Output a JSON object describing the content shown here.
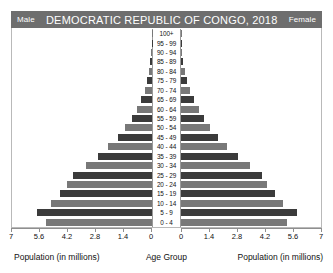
{
  "header": {
    "left_label": "Male",
    "title": "DEMOCRATIC REPUBLIC OF CONGO, 2018",
    "right_label": "Female"
  },
  "footer": {
    "left_caption": "Population (in millions)",
    "center_caption": "Age Group",
    "right_caption": "Population (in millions)"
  },
  "colors": {
    "header_background": "#6e6e6e",
    "header_text": "#ffffff",
    "bar_light": "#787878",
    "bar_dark": "#3b3b3b",
    "frame": "#b9b9b9",
    "axis": "#8f8f8f"
  },
  "chart_data": {
    "type": "bar",
    "subtype": "population-pyramid",
    "title": "DEMOCRATIC REPUBLIC OF CONGO, 2018",
    "xlabel": "Population (in millions)",
    "ylabel": "Age Group",
    "grid": false,
    "legend_position": "header",
    "axis_max": 7,
    "left_axis_ticks": [
      "7",
      "5.6",
      "4.2",
      "2.8",
      "1.4",
      "0"
    ],
    "right_axis_ticks": [
      "0",
      "1.4",
      "2.8",
      "4.2",
      "5.6",
      "7"
    ],
    "tick_values": [
      7,
      5.6,
      4.2,
      2.8,
      1.4,
      0
    ],
    "categories": [
      "100+",
      "95 - 99",
      "90 - 94",
      "85 - 89",
      "80 - 84",
      "75 - 79",
      "70 - 74",
      "65 - 69",
      "60 - 64",
      "55 - 59",
      "50 - 54",
      "45 - 49",
      "40 - 44",
      "35 - 39",
      "30 - 34",
      "25 - 29",
      "20 - 24",
      "15 - 19",
      "10 - 14",
      "5 - 9",
      "0 - 4"
    ],
    "series": [
      {
        "name": "Male",
        "side": "left",
        "values": [
          0.01,
          0.02,
          0.04,
          0.08,
          0.14,
          0.23,
          0.37,
          0.55,
          0.76,
          1.02,
          1.33,
          1.72,
          2.18,
          2.72,
          3.32,
          3.95,
          4.25,
          4.62,
          5.05,
          5.75,
          5.3
        ]
      },
      {
        "name": "Female",
        "side": "right",
        "values": [
          0.01,
          0.03,
          0.06,
          0.11,
          0.19,
          0.3,
          0.46,
          0.66,
          0.89,
          1.15,
          1.47,
          1.86,
          2.32,
          2.86,
          3.45,
          4.05,
          4.32,
          4.68,
          5.1,
          5.78,
          5.32
        ]
      }
    ]
  }
}
